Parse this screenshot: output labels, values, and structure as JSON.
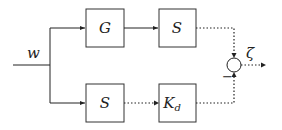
{
  "diagram": {
    "input_label": "w",
    "output_label": "ζ",
    "blocks": [
      {
        "id": "G",
        "label": "G"
      },
      {
        "id": "S_top",
        "label": "S"
      },
      {
        "id": "S_bottom",
        "label": "S"
      },
      {
        "id": "Kd",
        "label": "K",
        "subscript": "d"
      }
    ],
    "summing_junction": {
      "minus_sign": "−"
    }
  }
}
